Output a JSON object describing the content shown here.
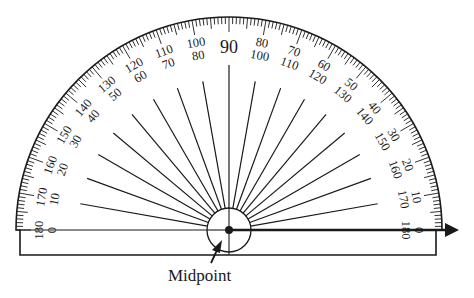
{
  "diagram": {
    "caption": "Midpoint",
    "colors": {
      "ink": "#1a1a1a",
      "background": "#ffffff"
    },
    "scale": {
      "range_degrees": [
        0,
        180
      ],
      "minor_tick_every": 1,
      "mid_tick_every": 5,
      "major_tick_every": 10
    },
    "outer_labels": [
      "180",
      "170",
      "160",
      "150",
      "140",
      "130",
      "120",
      "110",
      "100",
      "90",
      "80",
      "70",
      "60",
      "50",
      "40",
      "30",
      "20",
      "10",
      "0"
    ],
    "inner_labels": [
      "0",
      "10",
      "20",
      "30",
      "40",
      "50",
      "60",
      "70",
      "80",
      "90",
      "100",
      "110",
      "120",
      "130",
      "140",
      "150",
      "160",
      "170",
      "180"
    ],
    "center_label": "90",
    "ray": {
      "angle_degrees": 0,
      "description": "Arrow ray along baseline from midpoint pointing right"
    },
    "midpoint_marker": {
      "label": "Midpoint"
    }
  }
}
